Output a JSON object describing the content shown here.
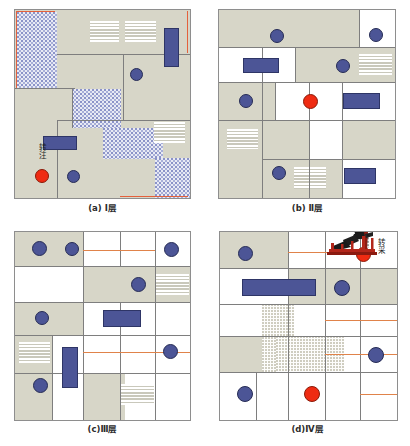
{
  "figure": {
    "type": "well-pattern-layer-maps",
    "panel_count": 4
  },
  "panels": [
    {
      "id": "a",
      "caption": "(a) Ⅰ层",
      "layer": "Ⅰ",
      "legend": {
        "label": "转注",
        "marker": "red-circle"
      },
      "features": {
        "background": "beige",
        "textures": [
          "blue-stipple",
          "white-hatch"
        ],
        "blue_rectangles": 2,
        "blue_circles": 3,
        "red_circles": 1,
        "hatch_blocks": 3
      }
    },
    {
      "id": "b",
      "caption": "(b) Ⅱ层",
      "layer": "Ⅱ",
      "features": {
        "background": "beige-white-grid",
        "textures": [
          "white-hatch"
        ],
        "blue_rectangles": 3,
        "blue_circles": 5,
        "red_circles": 1,
        "hatch_blocks": 3
      }
    },
    {
      "id": "c",
      "caption": "(c)Ⅲ层",
      "layer": "Ⅲ",
      "features": {
        "background": "beige-white-grid",
        "textures": [
          "white-hatch"
        ],
        "blue_rectangles": 2,
        "blue_circles": 6,
        "red_circles": 0,
        "hatch_blocks": 3
      }
    },
    {
      "id": "d",
      "caption": "(d)Ⅳ层",
      "layer": "Ⅳ",
      "legend": {
        "label": "转采",
        "marker": "red-circle",
        "icon": "pumpjack-icon"
      },
      "features": {
        "background": "beige-white-grid",
        "textures": [
          "gray-dots"
        ],
        "blue_rectangles": 1,
        "blue_circles": 3,
        "red_circles": 2,
        "hatch_blocks": 0
      }
    }
  ],
  "colors": {
    "beige": "#d7d6c8",
    "white": "#ffffff",
    "blue": "#4c5596",
    "blue_border": "#2e3566",
    "red": "#ef2b12",
    "grid_line": "#7e7e7e",
    "orange_line": "#e0834a",
    "stipple_blue": "#8b93c8"
  }
}
